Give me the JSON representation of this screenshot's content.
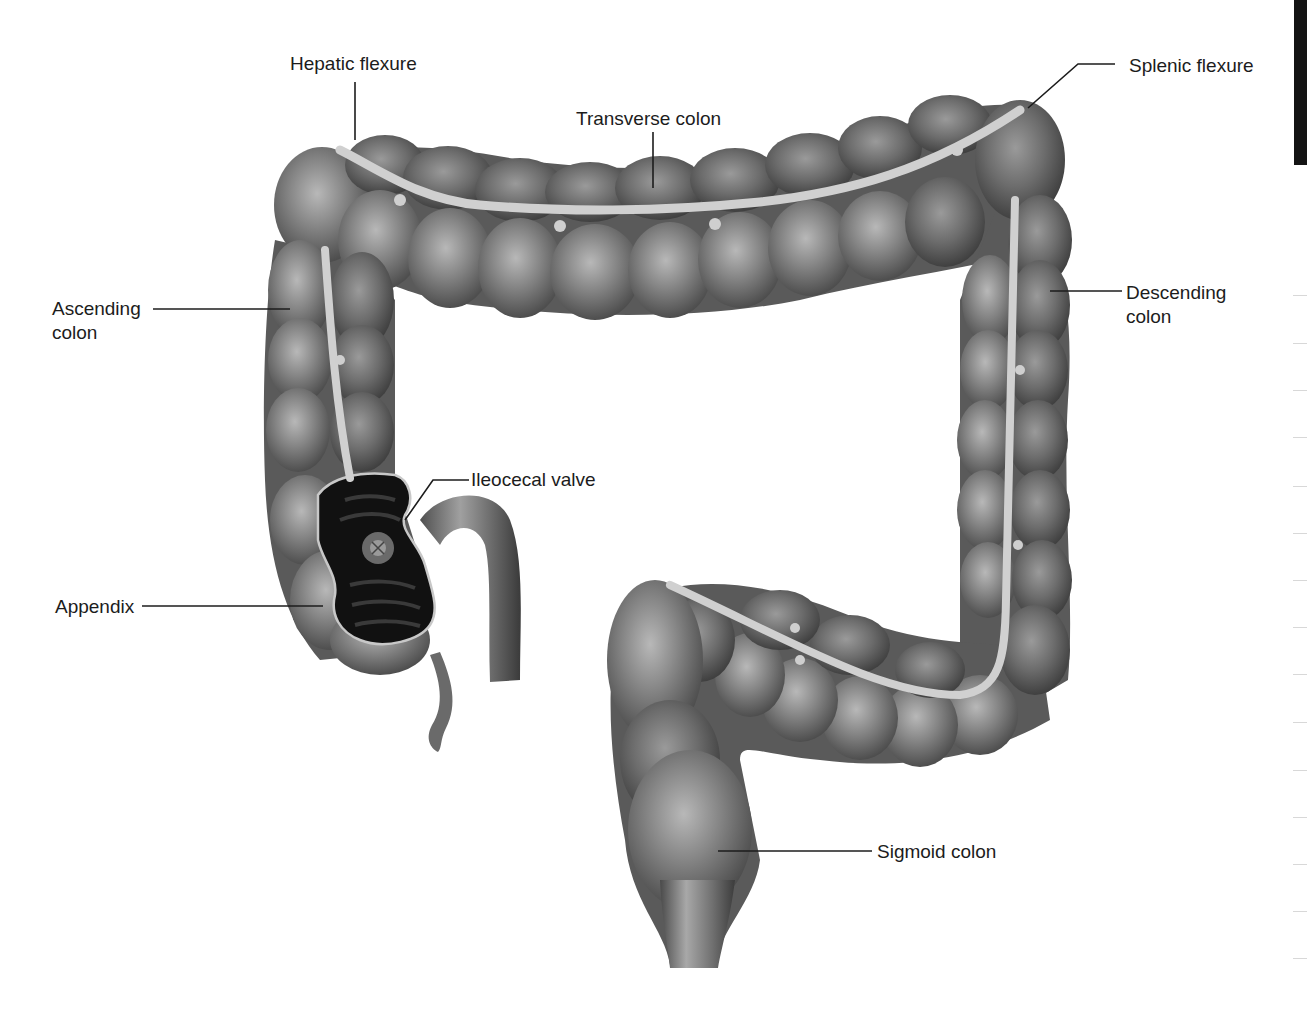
{
  "figure": {
    "colors": {
      "background": "#ffffff",
      "colon_fill": "#7a7a7a",
      "colon_highlight": "#b5b5b5",
      "colon_shadow": "#3e3e3e",
      "taenia_band": "#cfcfcf",
      "cecum_interior": "#111111",
      "leader_line": "#1c1c1c",
      "label_text": "#1c1c1c",
      "edge_bar": "#141414"
    }
  },
  "labels": {
    "hepatic_flexure": "Hepatic flexure",
    "transverse_colon": "Transverse colon",
    "splenic_flexure": "Splenic flexure",
    "ascending_colon_line1": "Ascending",
    "ascending_colon_line2": "colon",
    "descending_colon_line1": "Descending",
    "descending_colon_line2": "colon",
    "ileocecal_valve": "Ileocecal valve",
    "appendix": "Appendix",
    "sigmoid_colon": "Sigmoid colon"
  }
}
